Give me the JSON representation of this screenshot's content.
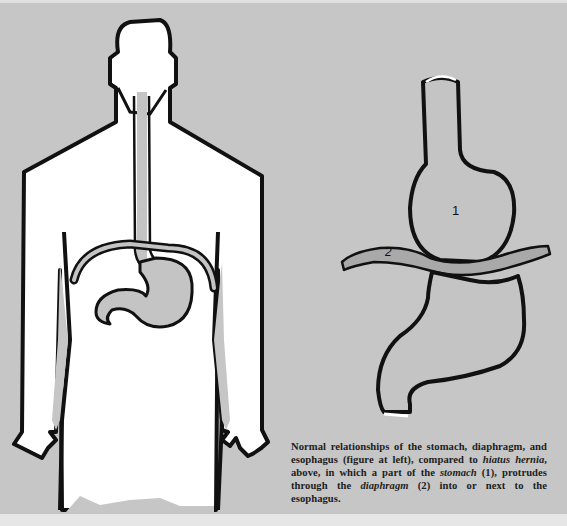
{
  "figure": {
    "left_title": "Normal anatomy: body outline with esophagus, diaphragm and stomach",
    "right_title": "Hiatus hernia",
    "labels": {
      "stomach_number": "1",
      "diaphragm_number": "2"
    },
    "colors": {
      "background": "#c6c6c6",
      "outline": "#111111",
      "body_fill": "#ffffff",
      "organ_fill": "#c4c4c4"
    }
  },
  "caption": {
    "part1": "Normal relationships of the stomach, diaphragm, and esophagus (figure at left), compared to ",
    "term_hiatus": "hiatus hernia",
    "part2": ", above, in which a part of the ",
    "term_stomach": "stomach",
    "part3": " (1), protrudes through the ",
    "term_diaphragm": "diaphragm",
    "part4": " (2) into or next to the esophagus."
  }
}
